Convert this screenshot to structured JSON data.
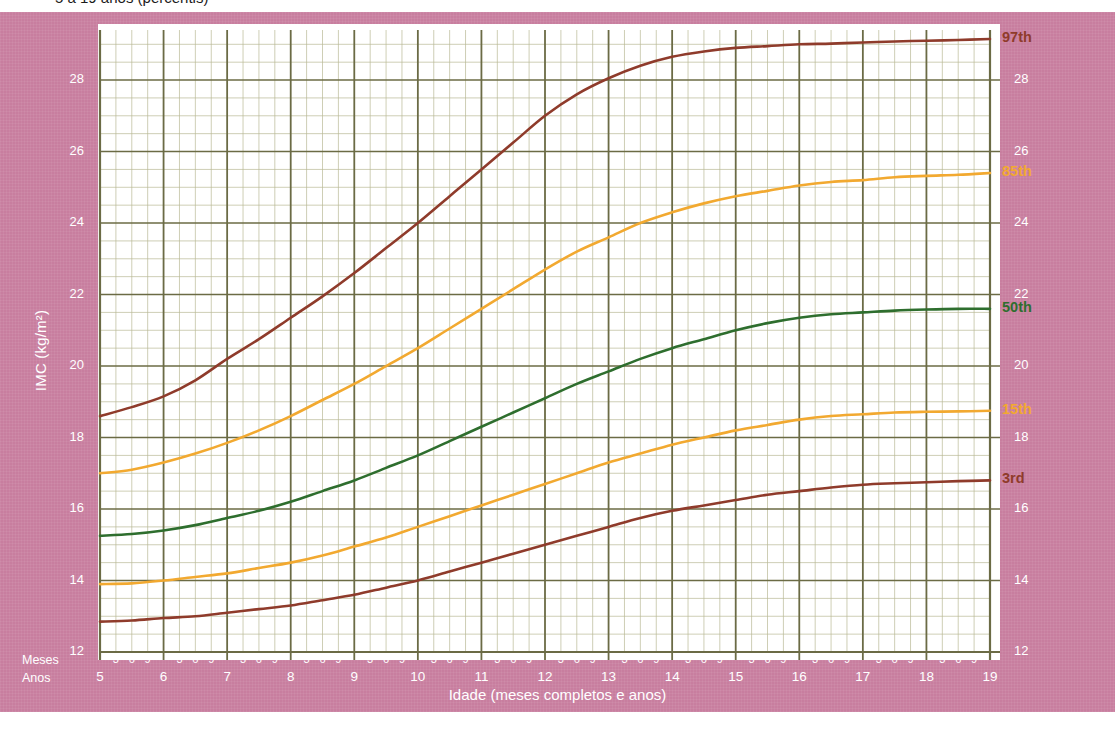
{
  "title": {
    "line_cropped": "5 a 19 anos (percentis)"
  },
  "axes": {
    "y_title": "IMC (kg/m²)",
    "x_title": "Idade (meses completos e anos)",
    "row_label_months": "Meses",
    "row_label_years": "Anos",
    "y_ticks": [
      "12",
      "14",
      "16",
      "18",
      "20",
      "22",
      "24",
      "26",
      "28"
    ],
    "x_year_ticks": [
      "5",
      "6",
      "7",
      "8",
      "9",
      "10",
      "11",
      "12",
      "13",
      "14",
      "15",
      "16",
      "17",
      "18",
      "19"
    ],
    "x_month_ticks": [
      "3",
      "6",
      "9"
    ]
  },
  "colors": {
    "panel_pink": "#c87e9f",
    "grid_major": "#6b6b45",
    "grid_minor": "#b9b995",
    "p97": "#8f3b2b",
    "p85": "#f2a930",
    "p50": "#2e6e2e",
    "p15": "#f2a930",
    "p3": "#8f3b2b",
    "tick_text": "#ffffff",
    "plot_bg": "#ffffff"
  },
  "chart_data": {
    "type": "line",
    "title": "5 a 19 anos (percentis)",
    "xlabel": "Idade (meses completos e anos)",
    "ylabel": "IMC (kg/m²)",
    "xlim": [
      5,
      19
    ],
    "ylim": [
      12,
      29.4
    ],
    "grid": true,
    "legend_position": "right-of-plot",
    "x": [
      5,
      5.5,
      6,
      6.5,
      7,
      7.5,
      8,
      8.5,
      9,
      9.5,
      10,
      10.5,
      11,
      11.5,
      12,
      12.5,
      13,
      13.5,
      14,
      14.5,
      15,
      15.5,
      16,
      16.5,
      17,
      17.5,
      18,
      18.5,
      19
    ],
    "series": [
      {
        "name": "97th",
        "label": "97th",
        "color": "#8f3b2b",
        "values": [
          18.6,
          18.85,
          19.15,
          19.6,
          20.2,
          20.75,
          21.35,
          21.95,
          22.6,
          23.3,
          24.0,
          24.75,
          25.5,
          26.25,
          27.0,
          27.6,
          28.05,
          28.4,
          28.65,
          28.8,
          28.9,
          28.95,
          29.0,
          29.02,
          29.05,
          29.08,
          29.1,
          29.12,
          29.15
        ]
      },
      {
        "name": "85th",
        "label": "85th",
        "color": "#f2a930",
        "values": [
          17.0,
          17.1,
          17.3,
          17.55,
          17.85,
          18.2,
          18.6,
          19.05,
          19.5,
          20.0,
          20.5,
          21.05,
          21.6,
          22.15,
          22.7,
          23.2,
          23.6,
          24.0,
          24.3,
          24.55,
          24.75,
          24.9,
          25.05,
          25.15,
          25.2,
          25.28,
          25.32,
          25.35,
          25.4
        ]
      },
      {
        "name": "50th",
        "label": "50th",
        "color": "#2e6e2e",
        "values": [
          15.25,
          15.3,
          15.4,
          15.55,
          15.75,
          15.95,
          16.2,
          16.5,
          16.8,
          17.15,
          17.5,
          17.9,
          18.3,
          18.7,
          19.1,
          19.5,
          19.85,
          20.2,
          20.5,
          20.75,
          21.0,
          21.2,
          21.35,
          21.45,
          21.5,
          21.55,
          21.58,
          21.6,
          21.6
        ]
      },
      {
        "name": "15th",
        "label": "15th",
        "color": "#f2a930",
        "values": [
          13.9,
          13.92,
          14.0,
          14.1,
          14.2,
          14.35,
          14.5,
          14.7,
          14.95,
          15.2,
          15.5,
          15.8,
          16.1,
          16.4,
          16.7,
          17.0,
          17.3,
          17.55,
          17.8,
          18.0,
          18.2,
          18.35,
          18.5,
          18.6,
          18.65,
          18.7,
          18.72,
          18.73,
          18.75
        ]
      },
      {
        "name": "3rd",
        "label": "3rd",
        "color": "#8f3b2b",
        "values": [
          12.85,
          12.88,
          12.95,
          13.0,
          13.1,
          13.2,
          13.3,
          13.45,
          13.6,
          13.8,
          14.0,
          14.25,
          14.5,
          14.75,
          15.0,
          15.25,
          15.5,
          15.75,
          15.95,
          16.1,
          16.25,
          16.4,
          16.5,
          16.6,
          16.68,
          16.72,
          16.75,
          16.78,
          16.8
        ]
      }
    ]
  }
}
